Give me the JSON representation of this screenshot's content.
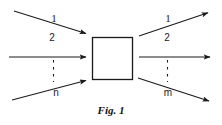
{
  "figure": {
    "caption": "Fig. 1",
    "background_color": "#ffffff",
    "stroke_color": "#1a1a1a"
  },
  "block": {
    "name": "system-block",
    "label": "",
    "x": 92,
    "y": 37,
    "width": 41,
    "height": 43
  },
  "inputs": {
    "group_label": "",
    "ellipsis": "vertical-dots",
    "arrows": [
      {
        "label": "1",
        "from_x": 14,
        "from_y": 11,
        "to_x": 88,
        "to_y": 34,
        "label_x": 53,
        "label_y": 14
      },
      {
        "label": "2",
        "from_x": 9,
        "from_y": 57,
        "to_x": 88,
        "to_y": 57,
        "label_x": 52,
        "label_y": 38
      },
      {
        "label": "n",
        "from_x": 12,
        "from_y": 100,
        "to_x": 88,
        "to_y": 80,
        "label_x": 56,
        "label_y": 92
      }
    ]
  },
  "outputs": {
    "group_label": "",
    "ellipsis": "vertical-dots",
    "arrows": [
      {
        "label": "1",
        "from_x": 139,
        "from_y": 36,
        "to_x": 210,
        "to_y": 12,
        "label_x": 167,
        "label_y": 14
      },
      {
        "label": "2",
        "from_x": 139,
        "from_y": 57,
        "to_x": 212,
        "to_y": 57,
        "label_x": 167,
        "label_y": 38
      },
      {
        "label": "m",
        "from_x": 138,
        "from_y": 78,
        "to_x": 211,
        "to_y": 102,
        "label_x": 168,
        "label_y": 92
      }
    ]
  }
}
